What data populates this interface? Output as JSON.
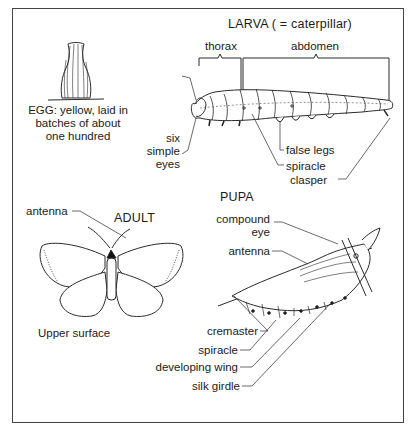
{
  "diagram": {
    "egg": {
      "caption_lines": [
        "EGG: yellow, laid in",
        "batches of about",
        "one hundred"
      ]
    },
    "larva": {
      "title": "LARVA ( = caterpillar)",
      "regions": [
        "thorax",
        "abdomen"
      ],
      "labels": {
        "eyes_lines": [
          "six",
          "simple",
          "eyes"
        ],
        "false_legs": "false legs",
        "spiracle": "spiracle",
        "clasper": "clasper"
      }
    },
    "adult": {
      "title": "ADULT",
      "antenna": "antenna",
      "caption": "Upper surface"
    },
    "pupa": {
      "title": "PUPA",
      "labels": {
        "compound_eye_lines": [
          "compound",
          "eye"
        ],
        "antenna": "antenna",
        "cremaster": "cremaster",
        "spiracle": "spiracle",
        "developing_wing": "developing wing",
        "silk_girdle": "silk girdle"
      }
    },
    "colors": {
      "line": "#2a2a2a",
      "background": "#ffffff",
      "frame": "#444444"
    }
  }
}
